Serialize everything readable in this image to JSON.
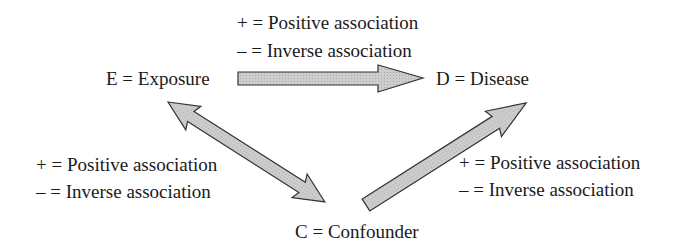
{
  "nodes": {
    "exposure": "E = Exposure",
    "disease": "D = Disease",
    "confounder": "C = Confounder"
  },
  "legends": {
    "top": {
      "positive": "+ = Positive association",
      "inverse": "– = Inverse association"
    },
    "left": {
      "positive": "+ = Positive association",
      "inverse": "– = Inverse association"
    },
    "right": {
      "positive": "+ = Positive association",
      "inverse": "– = Inverse association"
    }
  },
  "edges": [
    {
      "from": "E",
      "to": "D",
      "type": "single-arrow"
    },
    {
      "from": "E",
      "to": "C",
      "type": "double-arrow"
    },
    {
      "from": "C",
      "to": "D",
      "type": "single-arrow"
    }
  ],
  "colors": {
    "arrow_fill": "#c8c8c8",
    "arrow_stroke": "#333333",
    "text": "#1a1a1a"
  }
}
